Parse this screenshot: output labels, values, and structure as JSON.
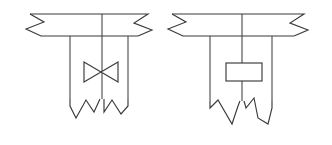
{
  "figure": {
    "background_color": "#ffffff",
    "line_color": "#3a3a3a",
    "width": 332,
    "height": 145,
    "diagram_count": 2
  },
  "diagrams": [
    {
      "id": "left-diagram",
      "name": "valve-branch-schematic",
      "label": "",
      "inline_component": {
        "type": "butterfly-valve",
        "symbol": "bowtie",
        "name": "butterfly-valve-symbol",
        "x": 84,
        "y": 62,
        "width": 34,
        "height": 20
      },
      "header_band": {
        "name": "horizontal-duct-band",
        "top_y": 14,
        "bottom_y": 36,
        "left_x": 30,
        "right_x": 148,
        "left_break": true,
        "right_break": true
      },
      "verticals": [
        {
          "name": "left-branch-line",
          "x": 70,
          "from_y": 36,
          "to_y": 104
        },
        {
          "name": "center-main-line",
          "x": 102,
          "from_y": 14,
          "to_y": 104
        },
        {
          "name": "right-branch-line",
          "x": 128,
          "from_y": 36,
          "to_y": 104
        }
      ],
      "bottom_breaks": [
        {
          "name": "left-bottom-break",
          "left_x": 70,
          "right_x": 100
        },
        {
          "name": "right-bottom-break",
          "left_x": 104,
          "right_x": 128
        }
      ]
    },
    {
      "id": "right-diagram",
      "name": "orifice-branch-schematic",
      "label": "",
      "inline_component": {
        "type": "orifice-restrictor",
        "symbol": "rectangle",
        "name": "orifice-plate-symbol",
        "x": 226,
        "y": 63,
        "width": 36,
        "height": 18
      },
      "header_band": {
        "name": "horizontal-duct-band",
        "top_y": 14,
        "bottom_y": 36,
        "left_x": 172,
        "right_x": 304,
        "left_break": true,
        "right_break": true
      },
      "verticals": [
        {
          "name": "left-branch-line",
          "x": 210,
          "from_y": 36,
          "to_y": 106
        },
        {
          "name": "center-main-line",
          "x": 242,
          "from_y": 14,
          "to_y": 106
        },
        {
          "name": "right-branch-line",
          "x": 272,
          "from_y": 36,
          "to_y": 106
        }
      ],
      "bottom_breaks": [
        {
          "name": "left-bottom-break",
          "left_x": 210,
          "right_x": 240
        },
        {
          "name": "right-bottom-break",
          "left_x": 244,
          "right_x": 272
        }
      ]
    }
  ],
  "legend": {
    "break_symbol_name": "zigzag-break-line",
    "notes": ""
  }
}
